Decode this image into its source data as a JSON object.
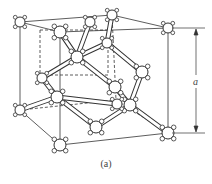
{
  "figure": {
    "caption": "(a)",
    "dimension_label": "a",
    "colors": {
      "line": "#333333",
      "atom_fill": "#ffffff",
      "background": "#ffffff"
    }
  },
  "cube": {
    "front_top_left": [
      60,
      32
    ],
    "front_top_right": [
      168,
      28
    ],
    "front_bottom_left": [
      60,
      145
    ],
    "front_bottom_right": [
      168,
      133
    ],
    "back_top_left": [
      20,
      22
    ],
    "back_top_right": [
      112,
      15
    ],
    "back_bottom_left": [
      20,
      110
    ],
    "back_bottom_right": [
      116,
      100
    ]
  },
  "atoms": [
    {
      "id": "c1",
      "x": 20,
      "y": 22,
      "r": 5
    },
    {
      "id": "c2",
      "x": 112,
      "y": 15,
      "r": 5
    },
    {
      "id": "c3",
      "x": 168,
      "y": 28,
      "r": 5
    },
    {
      "id": "c4",
      "x": 60,
      "y": 32,
      "r": 6
    },
    {
      "id": "c5",
      "x": 20,
      "y": 110,
      "r": 5
    },
    {
      "id": "c6",
      "x": 60,
      "y": 145,
      "r": 6
    },
    {
      "id": "c7",
      "x": 168,
      "y": 133,
      "r": 6
    },
    {
      "id": "f1",
      "x": 90,
      "y": 22,
      "r": 5
    },
    {
      "id": "i1",
      "x": 77,
      "y": 57,
      "r": 6
    },
    {
      "id": "i2",
      "x": 107,
      "y": 43,
      "r": 5
    },
    {
      "id": "f2",
      "x": 42,
      "y": 78,
      "r": 5
    },
    {
      "id": "f3",
      "x": 142,
      "y": 72,
      "r": 6
    },
    {
      "id": "i3",
      "x": 57,
      "y": 97,
      "r": 6
    },
    {
      "id": "f4",
      "x": 115,
      "y": 87,
      "r": 6
    },
    {
      "id": "f5",
      "x": 96,
      "y": 127,
      "r": 6
    },
    {
      "id": "i4",
      "x": 130,
      "y": 105,
      "r": 6
    },
    {
      "id": "f6",
      "x": 117,
      "y": 104,
      "r": 5
    }
  ],
  "bonds": [
    [
      "c4",
      "i1"
    ],
    [
      "f1",
      "i1"
    ],
    [
      "i1",
      "i2"
    ],
    [
      "c2",
      "i2"
    ],
    [
      "i2",
      "f3"
    ],
    [
      "i1",
      "f2"
    ],
    [
      "f2",
      "i3"
    ],
    [
      "i1",
      "f4"
    ],
    [
      "f4",
      "i4"
    ],
    [
      "f3",
      "i4"
    ],
    [
      "i4",
      "c7"
    ],
    [
      "i3",
      "c5"
    ],
    [
      "i3",
      "f5"
    ],
    [
      "f5",
      "i4"
    ],
    [
      "i3",
      "f6"
    ]
  ]
}
